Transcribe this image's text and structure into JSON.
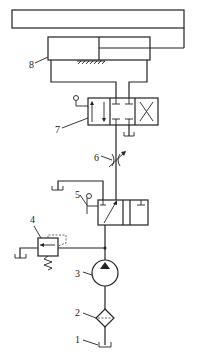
{
  "diagram": {
    "type": "hydraulic-circuit",
    "components": [
      {
        "id": "1",
        "label": "1",
        "name": "oil-tank"
      },
      {
        "id": "2",
        "label": "2",
        "name": "filter"
      },
      {
        "id": "3",
        "label": "3",
        "name": "hydraulic-pump"
      },
      {
        "id": "4",
        "label": "4",
        "name": "relief-valve"
      },
      {
        "id": "5",
        "label": "5",
        "name": "shutoff-directional-valve"
      },
      {
        "id": "6",
        "label": "6",
        "name": "throttle-valve"
      },
      {
        "id": "7",
        "label": "7",
        "name": "directional-control-valve"
      },
      {
        "id": "8",
        "label": "8",
        "name": "hydraulic-cylinder"
      }
    ],
    "line_color": "#222222",
    "background": "#ffffff"
  }
}
